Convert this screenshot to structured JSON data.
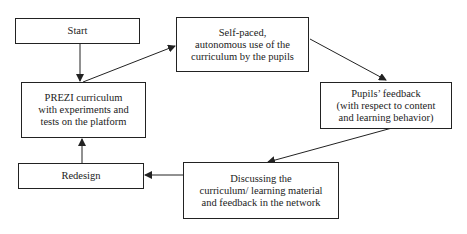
{
  "diagram": {
    "nodes": [
      {
        "id": "start",
        "lines": [
          "Start"
        ]
      },
      {
        "id": "self_paced",
        "lines": [
          "Self-paced,",
          "autonomous use of the",
          "curriculum by the pupils"
        ]
      },
      {
        "id": "prezi",
        "lines": [
          "PREZI curriculum",
          "with experiments and",
          "tests on the platform"
        ]
      },
      {
        "id": "feedback",
        "lines": [
          "Pupils’ feedback",
          "(with respect to content",
          "and learning behavior)"
        ]
      },
      {
        "id": "redesign",
        "lines": [
          "Redesign"
        ]
      },
      {
        "id": "discussing",
        "lines": [
          "Discussing the",
          "curriculum/ learning material",
          "and feedback in the network"
        ]
      }
    ],
    "edges": [
      {
        "from": "start",
        "to": "prezi"
      },
      {
        "from": "prezi",
        "to": "self_paced"
      },
      {
        "from": "self_paced",
        "to": "feedback"
      },
      {
        "from": "feedback",
        "to": "discussing"
      },
      {
        "from": "discussing",
        "to": "redesign"
      },
      {
        "from": "redesign",
        "to": "prezi"
      }
    ],
    "colors": {
      "stroke": "#222222",
      "background": "#ffffff"
    }
  }
}
